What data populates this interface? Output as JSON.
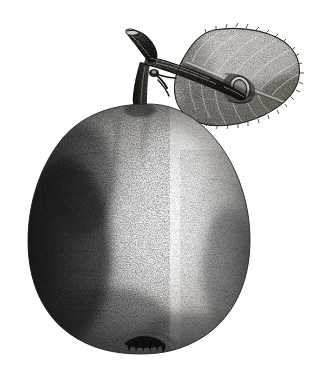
{
  "illustration": {
    "title": "Pear",
    "subject": "pear-fruit-with-stem-and-leaf",
    "medium": "stipple-engraving",
    "style": "monochrome-botanical-plate",
    "canvas": {
      "width": 317,
      "height": 376,
      "background_color": "#ffffff"
    },
    "palette": {
      "background": "#ffffff",
      "ink_darkest": "#1d1d1d",
      "ink_dark": "#3a3a3a",
      "ink_mid": "#6e6e6e",
      "ink_light": "#a8a8a8",
      "ink_pale": "#d2d2d2",
      "highlight": "#f4f4f2",
      "outline": "#2b2b2b"
    },
    "parts": [
      {
        "id": "fruit-body",
        "name": "pear-body",
        "shape": "pyriform",
        "bounds": {
          "x": 28,
          "y": 100,
          "width": 222,
          "height": 252
        },
        "light_direction": "upper-right",
        "shadow_side": "left",
        "highlight_center": {
          "x": 158,
          "y": 225
        },
        "notes": "broad rounded base tapering to narrow shoulder; lumpy shoulder with shallow groove"
      },
      {
        "id": "fruit-calyx",
        "name": "calyx-sepals",
        "shape": "dried-pointed-sepal-tuft",
        "bounds": {
          "x": 124,
          "y": 338,
          "width": 42,
          "height": 16
        },
        "sepal_count": 6,
        "tone": "#141414"
      },
      {
        "id": "fruit-stem",
        "name": "fruit-stem",
        "shape": "short-thick-curved-stalk",
        "bounds": {
          "x": 127,
          "y": 62,
          "width": 22,
          "height": 48
        }
      },
      {
        "id": "twig",
        "name": "woody-twig",
        "shape": "forked-branch",
        "bounds": {
          "x": 124,
          "y": 28,
          "width": 122,
          "height": 72
        },
        "segments": [
          {
            "name": "upper-left-spur",
            "from": [
              128,
              34
            ],
            "to": [
              158,
              62
            ]
          },
          {
            "name": "main-shoot-right",
            "from": [
              152,
              58
            ],
            "to": [
              243,
              95
            ]
          },
          {
            "name": "stem-junction",
            "at": [
              150,
              64
            ]
          }
        ],
        "features": [
          "bark-ridges",
          "lenticel-speckles",
          "small-thorn-spurs",
          "blunt-cut-tip"
        ]
      },
      {
        "id": "leaf",
        "name": "pear-leaf",
        "shape": "broad-ovate-rounded",
        "bounds": {
          "x": 176,
          "y": 28,
          "width": 124,
          "height": 98
        },
        "margin": "finely-crenate-serrate",
        "venation": "pinnate",
        "vein_pairs": 7,
        "features": [
          "curled-rolled-tip",
          "midrib-shadow",
          "overlapped-by-twig"
        ]
      }
    ],
    "texture": {
      "technique": "stipple-and-hatch",
      "dot_density_shadow": "high",
      "dot_density_highlight": "low"
    }
  }
}
